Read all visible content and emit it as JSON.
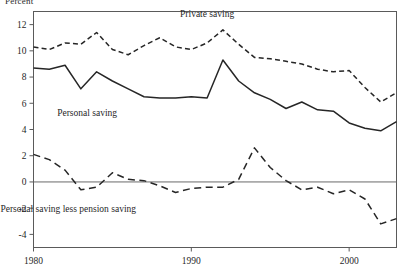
{
  "unit_label": "Percent",
  "chart_data": {
    "type": "line",
    "title": "",
    "xlabel": "",
    "ylabel": "Percent",
    "xlim": [
      1980,
      2003
    ],
    "ylim": [
      -5,
      13
    ],
    "grid": false,
    "zero_line": true,
    "legend_position": "inline-annotations",
    "x_ticks": [
      1980,
      1990,
      2000
    ],
    "x_tick_labels": [
      "1980",
      "1990",
      "2000"
    ],
    "y_ticks": [
      -4,
      -2,
      0,
      2,
      4,
      6,
      8,
      10,
      12
    ],
    "y_tick_labels": [
      "-4",
      "-2",
      "0",
      "2",
      "4",
      "6",
      "8",
      "10",
      "12"
    ],
    "x": [
      1980,
      1981,
      1982,
      1983,
      1984,
      1985,
      1986,
      1987,
      1988,
      1989,
      1990,
      1991,
      1992,
      1993,
      1994,
      1995,
      1996,
      1997,
      1998,
      1999,
      2000,
      2001,
      2002,
      2003
    ],
    "series": [
      {
        "name": "Private saving",
        "style": "dashed",
        "color": "#262626",
        "label_x": 1991.0,
        "label_y": 12.6,
        "values": [
          10.3,
          10.1,
          10.6,
          10.5,
          11.4,
          10.1,
          9.7,
          10.4,
          11.0,
          10.3,
          10.1,
          10.6,
          11.6,
          10.5,
          9.5,
          9.4,
          9.2,
          9.0,
          8.6,
          8.4,
          8.5,
          7.2,
          6.1,
          6.8
        ]
      },
      {
        "name": "Personal saving",
        "style": "solid",
        "color": "#262626",
        "label_x": 1983.4,
        "label_y": 5.0,
        "values": [
          8.7,
          8.6,
          8.9,
          7.1,
          8.4,
          7.7,
          7.1,
          6.5,
          6.4,
          6.4,
          6.5,
          6.4,
          9.3,
          7.7,
          6.8,
          6.3,
          5.6,
          6.1,
          5.5,
          5.4,
          4.5,
          4.1,
          3.9,
          4.6
        ]
      },
      {
        "name": "Personal saving less pension saving",
        "style": "long-dashed",
        "color": "#262626",
        "label_x": 1982.2,
        "label_y": -2.3,
        "values": [
          2.1,
          1.7,
          0.9,
          -0.6,
          -0.4,
          0.7,
          0.2,
          0.1,
          -0.3,
          -0.8,
          -0.5,
          -0.4,
          -0.4,
          0.2,
          2.6,
          1.1,
          0.1,
          -0.6,
          -0.4,
          -0.9,
          -0.6,
          -1.3,
          -3.2,
          -2.8
        ]
      }
    ]
  }
}
